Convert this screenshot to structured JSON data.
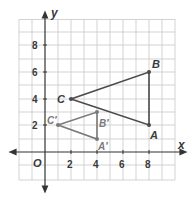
{
  "diagram": {
    "type": "coordinate-plane",
    "axes": {
      "x_label": "x",
      "y_label": "y",
      "origin_label": "O",
      "x_ticks": [
        "2",
        "4",
        "6",
        "8"
      ],
      "y_ticks": [
        "2",
        "4",
        "6",
        "8"
      ]
    },
    "triangles": [
      {
        "name": "ABC",
        "color": "#4a4a4a",
        "vertices": [
          {
            "label": "A",
            "x": 8,
            "y": 2
          },
          {
            "label": "B",
            "x": 8,
            "y": 6
          },
          {
            "label": "C",
            "x": 2,
            "y": 4
          }
        ]
      },
      {
        "name": "A'B'C'",
        "color": "#7a7a7a",
        "vertices": [
          {
            "label": "A′",
            "x": 4,
            "y": 1
          },
          {
            "label": "B′",
            "x": 4,
            "y": 3
          },
          {
            "label": "C′",
            "x": 1,
            "y": 2
          }
        ]
      }
    ]
  }
}
